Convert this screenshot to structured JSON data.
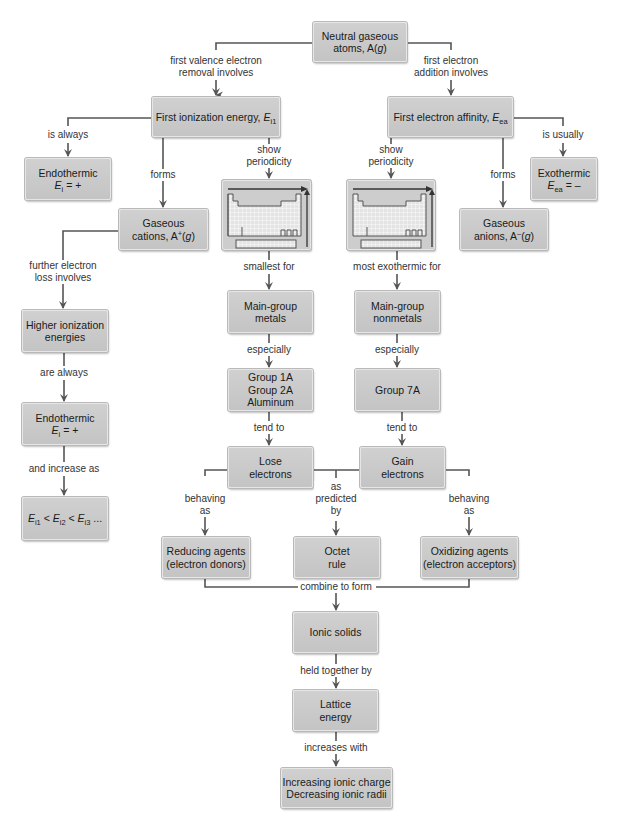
{
  "diagram": {
    "nodes": {
      "neutral_atoms": {
        "line1": "Neutral gaseous",
        "line2_pre": "atoms, A(",
        "line2_it": "g",
        "line2_post": ")"
      },
      "first_ionization": {
        "text": "First ionization energy, ",
        "sym": "E",
        "sub": "i1"
      },
      "first_affinity": {
        "text": "First electron affinity, ",
        "sym": "E",
        "sub": "ea"
      },
      "endothermic_1": {
        "line1": "Endothermic",
        "sym": "E",
        "sub": "i",
        "rest": " = +"
      },
      "exothermic": {
        "line1": "Exothermic",
        "sym": "E",
        "sub": "ea",
        "rest": " = –"
      },
      "gaseous_cations": {
        "line1": "Gaseous",
        "line2_pre": "cations, A",
        "sup": "+",
        "line2_mid": "(",
        "line2_it": "g",
        "line2_post": ")"
      },
      "gaseous_anions": {
        "line1": "Gaseous",
        "line2_pre": "anions, A",
        "sup": "–",
        "line2_mid": "(",
        "line2_it": "g",
        "line2_post": ")"
      },
      "periodic_table_left": {
        "icon": "periodic-table-trend-icon"
      },
      "periodic_table_right": {
        "icon": "periodic-table-trend-icon"
      },
      "higher_ionization": {
        "line1": "Higher ionization",
        "line2": "energies"
      },
      "endothermic_2": {
        "line1": "Endothermic",
        "sym": "E",
        "sub": "i",
        "rest": " = +"
      },
      "ionization_order": {
        "s1": "E",
        "b1": "i1",
        "lt1": " < ",
        "s2": "E",
        "b2": "i2",
        "lt2": " < ",
        "s3": "E",
        "b3": "i3",
        "tail": " ..."
      },
      "main_group_metals": {
        "line1": "Main-group",
        "line2": "metals"
      },
      "main_group_nonmetals": {
        "line1": "Main-group",
        "line2": "nonmetals"
      },
      "groups_metals": {
        "line1": "Group 1A",
        "line2": "Group 2A",
        "line3": "Aluminum"
      },
      "group_7a": {
        "line1": "Group 7A"
      },
      "lose_electrons": {
        "line1": "Lose",
        "line2": "electrons"
      },
      "gain_electrons": {
        "line1": "Gain",
        "line2": "electrons"
      },
      "reducing_agents": {
        "line1": "Reducing agents",
        "line2": "(electron donors)"
      },
      "octet_rule": {
        "line1": "Octet",
        "line2": "rule"
      },
      "oxidizing_agents": {
        "line1": "Oxidizing agents",
        "line2": "(electron acceptors)"
      },
      "ionic_solids": {
        "line1": "Ionic solids"
      },
      "lattice_energy": {
        "line1": "Lattice",
        "line2": "energy"
      },
      "ionic_factors": {
        "line1": "Increasing ionic charge",
        "line2": "Decreasing ionic radii"
      }
    },
    "links": {
      "first_valence_removal": {
        "line1": "first valence electron",
        "line2": "removal involves"
      },
      "first_addition": {
        "line1": "first electron",
        "line2": "addition involves"
      },
      "is_always": {
        "line1": "is always"
      },
      "is_usually": {
        "line1": "is usually"
      },
      "forms_left": {
        "line1": "forms"
      },
      "forms_right": {
        "line1": "forms"
      },
      "show_periodicity_left": {
        "line1": "show",
        "line2": "periodicity"
      },
      "show_periodicity_right": {
        "line1": "show",
        "line2": "periodicity"
      },
      "further_loss": {
        "line1": "further electron",
        "line2": "loss involves"
      },
      "are_always": {
        "line1": "are always"
      },
      "and_increase_as": {
        "line1": "and increase as"
      },
      "smallest_for": {
        "line1": "smallest for"
      },
      "most_exothermic_for": {
        "line1": "most exothermic for"
      },
      "especially_left": {
        "line1": "especially"
      },
      "especially_right": {
        "line1": "especially"
      },
      "tend_to_left": {
        "line1": "tend to"
      },
      "tend_to_right": {
        "line1": "tend to"
      },
      "behaving_as_left": {
        "line1": "behaving",
        "line2": "as"
      },
      "behaving_as_right": {
        "line1": "behaving",
        "line2": "as"
      },
      "as_predicted_by": {
        "line1": "as",
        "line2": "predicted",
        "line3": "by"
      },
      "combine_to_form": {
        "line1": "combine to form"
      },
      "held_together_by": {
        "line1": "held together by"
      },
      "increases_with": {
        "line1": "increases with"
      }
    },
    "colors": {
      "box": "#c9c9c9",
      "line": "#555555",
      "text": "#1a1a1a",
      "label": "#333333",
      "grid": "#ffffff"
    }
  }
}
